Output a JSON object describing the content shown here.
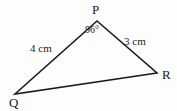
{
  "figure": {
    "type": "triangle-geometry-diagram",
    "background_color": "#fdfdfd",
    "stroke_color": "#1b1b1b",
    "text_color": "#1b1b1b",
    "vertices": {
      "P": {
        "label": "P",
        "x": 97,
        "y": 21
      },
      "Q": {
        "label": "Q",
        "x": 15,
        "y": 94
      },
      "R": {
        "label": "R",
        "x": 157,
        "y": 73
      }
    },
    "sides": {
      "PQ": {
        "label": "4 cm",
        "length": 4,
        "unit": "cm"
      },
      "PR": {
        "label": "3 cm",
        "length": 3,
        "unit": "cm"
      },
      "QR": {
        "label": "",
        "length": null,
        "unit": ""
      }
    },
    "angles": {
      "P": {
        "label": "96°",
        "value": 96,
        "unit": "degrees"
      }
    }
  }
}
